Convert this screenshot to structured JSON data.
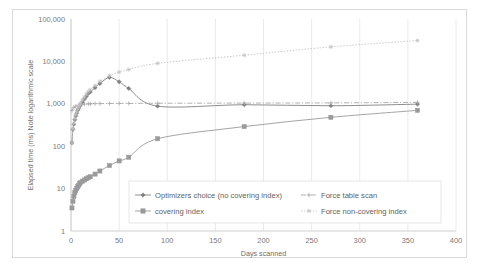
{
  "chart_data": {
    "type": "line",
    "title": "",
    "xlabel": "Days scanned",
    "ylabel": "Elapsed time (ms) Note logarithmic scale",
    "yscale": "log",
    "ylim": [
      1,
      100000
    ],
    "xlim": [
      0,
      400
    ],
    "grid": "vertical-major",
    "legend_position": "inside-bottom-center",
    "y_ticks": [
      "1",
      "10",
      "100",
      "1,000",
      "10,000",
      "100,000"
    ],
    "y_tick_values": [
      1,
      10,
      100,
      1000,
      10000,
      100000
    ],
    "x_ticks": [
      "0",
      "50",
      "100",
      "150",
      "200",
      "250",
      "300",
      "350",
      "400"
    ],
    "x_tick_values": [
      0,
      50,
      100,
      150,
      200,
      250,
      300,
      350,
      400
    ],
    "series": [
      {
        "name": "Optimizers choice (no covering index)",
        "color": "#808080",
        "marker": "diamond",
        "dash": "solid",
        "x": [
          1,
          2,
          3,
          4,
          5,
          6,
          7,
          8,
          9,
          10,
          12,
          14,
          16,
          18,
          20,
          25,
          30,
          40,
          50,
          60,
          90,
          180,
          270,
          360
        ],
        "y": [
          120,
          250,
          330,
          420,
          520,
          600,
          700,
          780,
          880,
          950,
          1100,
          1300,
          1500,
          1750,
          1900,
          2400,
          3000,
          4200,
          3300,
          2300,
          880,
          950,
          900,
          980
        ]
      },
      {
        "name": "covering index",
        "color": "#9a9a9a",
        "marker": "square",
        "dash": "solid",
        "x": [
          1,
          2,
          3,
          4,
          5,
          6,
          7,
          8,
          9,
          10,
          12,
          14,
          16,
          18,
          20,
          25,
          30,
          40,
          50,
          60,
          90,
          180,
          270,
          360
        ],
        "y": [
          3.5,
          5,
          6.5,
          8,
          9,
          10,
          11,
          12,
          13,
          14,
          15,
          16,
          17,
          18,
          19,
          22,
          26,
          35,
          45,
          55,
          150,
          290,
          480,
          700
        ]
      },
      {
        "name": "Force table scan",
        "color": "#a8a8a8",
        "marker": "plus",
        "dash": "dashdot",
        "x": [
          1,
          3,
          5,
          8,
          10,
          14,
          18,
          20,
          25,
          30,
          40,
          50,
          60,
          90,
          180,
          270,
          360
        ],
        "y": [
          700,
          820,
          880,
          920,
          950,
          980,
          1000,
          1000,
          1010,
          1010,
          1020,
          1020,
          1020,
          1030,
          1040,
          1050,
          1080
        ]
      },
      {
        "name": "Force non-covering index",
        "color": "#c2c2c2",
        "marker": "asterisk",
        "dash": "dotted",
        "x": [
          1,
          2,
          3,
          4,
          5,
          6,
          7,
          8,
          9,
          10,
          12,
          14,
          16,
          18,
          20,
          25,
          30,
          40,
          50,
          60,
          90,
          180,
          270,
          360
        ],
        "y": [
          120,
          260,
          350,
          450,
          560,
          650,
          760,
          850,
          950,
          1050,
          1250,
          1450,
          1700,
          1950,
          2150,
          2700,
          3400,
          4600,
          5600,
          6400,
          9000,
          14000,
          22000,
          31000
        ]
      }
    ],
    "legend_entries": [
      {
        "label": "Optimizers choice (no covering index)",
        "color": "#808080",
        "marker": "diamond",
        "dash": "solid"
      },
      {
        "label": "Force table scan",
        "color": "#a8a8a8",
        "marker": "plus",
        "dash": "dashdot"
      },
      {
        "label": "covering index",
        "color": "#9a9a9a",
        "marker": "square",
        "dash": "solid"
      },
      {
        "label": "Force non-covering index",
        "color": "#c2c2c2",
        "marker": "asterisk",
        "dash": "dotted"
      }
    ]
  }
}
